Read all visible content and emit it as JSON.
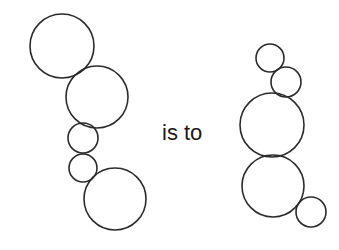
{
  "relation_text": "is to",
  "stroke_color": "#2b2b2b",
  "left_figure": {
    "name": "source-figure",
    "circles": [
      {
        "cx": 62,
        "cy": 46,
        "r": 32
      },
      {
        "cx": 97,
        "cy": 97,
        "r": 31
      },
      {
        "cx": 83,
        "cy": 138,
        "r": 15
      },
      {
        "cx": 83,
        "cy": 168,
        "r": 14
      },
      {
        "cx": 115,
        "cy": 199,
        "r": 31
      }
    ]
  },
  "right_figure": {
    "name": "target-figure",
    "circles": [
      {
        "cx": 270,
        "cy": 58,
        "r": 14
      },
      {
        "cx": 286,
        "cy": 82,
        "r": 15
      },
      {
        "cx": 272,
        "cy": 125,
        "r": 32
      },
      {
        "cx": 273,
        "cy": 186,
        "r": 31
      },
      {
        "cx": 311,
        "cy": 212,
        "r": 15
      }
    ]
  }
}
